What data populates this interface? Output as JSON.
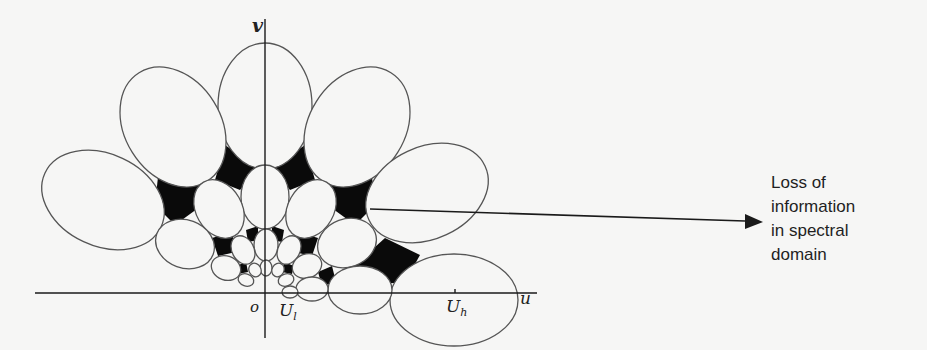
{
  "figure": {
    "axes": {
      "vertical_label": "v",
      "horizontal_label": "u",
      "origin_label": "o",
      "low_freq_label": "U",
      "low_freq_sub": "l",
      "high_freq_label": "U",
      "high_freq_sub": "h"
    },
    "annotation": {
      "lines": [
        "Loss of",
        "information",
        "in spectral",
        "domain"
      ]
    },
    "colors": {
      "background": "#f6f6f5",
      "ink": "#1a1a1a",
      "ellipse_stroke": "#555555",
      "gap_fill": "#0a0a0a"
    }
  }
}
